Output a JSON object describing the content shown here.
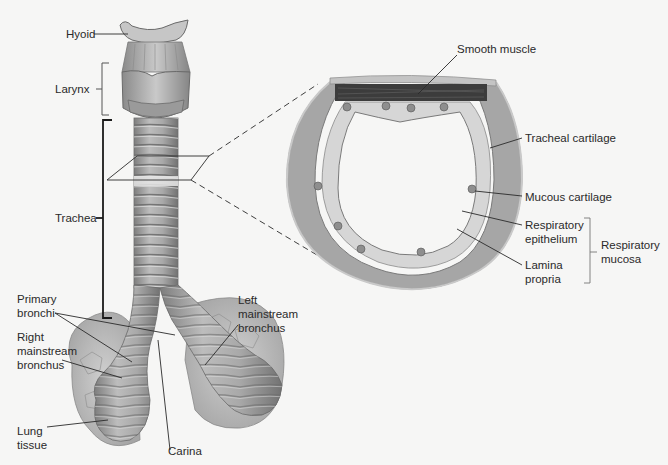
{
  "diagram": {
    "left_labels": {
      "hyoid": "Hyoid",
      "larynx": "Larynx",
      "trachea": "Trachea",
      "primary_bronchi": "Primary\nbronchi",
      "right_mainstream_bronchus": "Right\nmainstream\nbronchus",
      "lung_tissue": "Lung\ntissue",
      "carina": "Carina",
      "left_mainstream_bronchus": "Left\nmainstream\nbronchus"
    },
    "cross_section_labels": {
      "smooth_muscle": "Smooth muscle",
      "tracheal_cartilage": "Tracheal cartilage",
      "mucous_cartilage": "Mucous cartilage",
      "respiratory_epithelium": "Respiratory\nepithelium",
      "lamina_propria": "Lamina\npropria",
      "respiratory_mucosa": "Respiratory\nmucosa"
    },
    "colors": {
      "background": "#f6f6f5",
      "tissue_gray": "#9a9a9a",
      "cartilage_gray": "#a8a8a8",
      "muscle_dark": "#3a3a3a",
      "line": "#2a2a2a"
    }
  }
}
